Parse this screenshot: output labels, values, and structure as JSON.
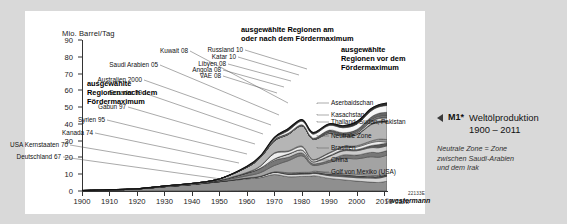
{
  "figure": {
    "panel_bg": "#ffffff",
    "page_bg": "#d9d9d9",
    "axis_title": "Mio. Barrel/Tag",
    "x_axis_name": "Jahr",
    "code": "22133E",
    "credit_symbol": "©",
    "credit": "westermann"
  },
  "caption": {
    "marker": "M1*",
    "title_line1": "Weltölproduktion",
    "title_line2": "1900 – 2011",
    "note_line1": "Neutrale Zone = Zone",
    "note_line2": "zwischen Saudi-Arabien",
    "note_line3": "und dem Irak"
  },
  "groups": {
    "left": "ausgewählte\nRegionen nach dem\nFördermaximum",
    "middle": "ausgewählte Regionen am\noder nach dem Fördermaximum",
    "right": "ausgewählte\nRegionen vor dem\nFördermaximum"
  },
  "callouts_left": [
    {
      "label": "Deutschland 67",
      "x": 36,
      "y": 142
    },
    {
      "label": "USA Kernstaaten 70",
      "x": 43,
      "y": 130
    },
    {
      "label": "Kanada 74",
      "x": 68,
      "y": 118
    },
    {
      "label": "Syrien 95",
      "x": 80,
      "y": 105
    },
    {
      "label": "Gabun 97",
      "x": 101,
      "y": 92
    },
    {
      "label": "Ecuador 99",
      "x": 117,
      "y": 78
    },
    {
      "label": "Australien 2000",
      "x": 117,
      "y": 65
    },
    {
      "label": "Saudi Arabien 05",
      "x": 133,
      "y": 50
    },
    {
      "label": "Kuwait 08",
      "x": 163,
      "y": 36
    }
  ],
  "callouts_middle": [
    {
      "label": "VAE 08",
      "x": 196,
      "y": 61
    },
    {
      "label": "Angola 08",
      "x": 196,
      "y": 55
    },
    {
      "label": "Libyen 08",
      "x": 201,
      "y": 49
    },
    {
      "label": "Katar 10",
      "x": 211,
      "y": 42
    },
    {
      "label": "Russland 10",
      "x": 218,
      "y": 35
    }
  ],
  "callouts_right": [
    {
      "label": "Aserbaidschan",
      "x": 306,
      "y": 88
    },
    {
      "label": "Kasachstan",
      "x": 306,
      "y": 100
    },
    {
      "label": "Thailand, Sudan, Pakistan",
      "x": 306,
      "y": 107
    },
    {
      "label": "Neutrale Zone",
      "x": 306,
      "y": 121
    },
    {
      "label": "Brasilien",
      "x": 306,
      "y": 133
    },
    {
      "label": "China",
      "x": 306,
      "y": 145
    },
    {
      "label": "Golf von Mexiko (USA)",
      "x": 306,
      "y": 157
    }
  ],
  "chart_data": {
    "type": "area",
    "title": "Weltölproduktion 1900 – 2011",
    "xlabel": "Jahr",
    "ylabel": "Mio. Barrel/Tag",
    "xlim": [
      1900,
      2011
    ],
    "ylim": [
      0,
      90
    ],
    "grid": false,
    "legend": "inline callout labels",
    "yticks": [
      0,
      10,
      20,
      30,
      40,
      50,
      60,
      70,
      80,
      90
    ],
    "xticks": [
      1900,
      1910,
      1920,
      1930,
      1940,
      1950,
      1960,
      1970,
      1980,
      1990,
      2000,
      2010
    ],
    "x": [
      1900,
      1910,
      1920,
      1930,
      1940,
      1950,
      1960,
      1965,
      1970,
      1975,
      1980,
      1983,
      1985,
      1990,
      1995,
      2000,
      2005,
      2008,
      2011
    ],
    "total_values": [
      0.4,
      1.0,
      2.0,
      3.8,
      5.9,
      10.9,
      21.0,
      30.0,
      45.7,
      53.0,
      62.9,
      53.5,
      54.0,
      60.5,
      62.4,
      68.3,
      73.8,
      73.7,
      74.0
    ],
    "series": [
      {
        "name": "Deutschland 67",
        "peak_year": 1967,
        "values": [
          0.0,
          0.0,
          0.0,
          0.1,
          0.1,
          0.1,
          0.2,
          0.2,
          0.2,
          0.1,
          0.1,
          0.1,
          0.1,
          0.1,
          0.1,
          0.1,
          0.1,
          0.1,
          0.1
        ]
      },
      {
        "name": "USA Kernstaaten 70",
        "peak_year": 1970,
        "values": [
          0.2,
          0.6,
          1.2,
          2.5,
          3.7,
          5.4,
          7.0,
          7.8,
          9.6,
          8.4,
          8.6,
          8.7,
          8.9,
          7.4,
          6.6,
          5.8,
          5.2,
          5.0,
          5.7
        ]
      },
      {
        "name": "Kanada 74",
        "peak_year": 1974,
        "values": [
          0.0,
          0.0,
          0.0,
          0.0,
          0.1,
          0.1,
          0.5,
          0.8,
          1.3,
          1.4,
          1.4,
          1.4,
          1.5,
          1.6,
          1.8,
          2.0,
          2.4,
          2.6,
          3.0
        ]
      },
      {
        "name": "Syrien 95",
        "peak_year": 1995,
        "values": [
          0,
          0,
          0,
          0,
          0,
          0,
          0.0,
          0.0,
          0.1,
          0.2,
          0.2,
          0.2,
          0.2,
          0.4,
          0.6,
          0.5,
          0.4,
          0.4,
          0.3
        ]
      },
      {
        "name": "Gabun 97",
        "peak_year": 1997,
        "values": [
          0,
          0,
          0,
          0,
          0,
          0,
          0.0,
          0.0,
          0.1,
          0.2,
          0.2,
          0.2,
          0.2,
          0.3,
          0.3,
          0.3,
          0.2,
          0.2,
          0.2
        ]
      },
      {
        "name": "Ecuador 99",
        "peak_year": 1999,
        "values": [
          0,
          0,
          0,
          0,
          0,
          0,
          0.0,
          0.0,
          0.0,
          0.2,
          0.2,
          0.2,
          0.3,
          0.3,
          0.4,
          0.4,
          0.5,
          0.5,
          0.5
        ]
      },
      {
        "name": "Australien 2000",
        "peak_year": 2000,
        "values": [
          0,
          0,
          0,
          0,
          0,
          0,
          0.0,
          0.0,
          0.1,
          0.4,
          0.4,
          0.4,
          0.6,
          0.6,
          0.6,
          0.8,
          0.6,
          0.5,
          0.5
        ]
      },
      {
        "name": "Saudi Arabien 05",
        "peak_year": 2005,
        "values": [
          0,
          0,
          0,
          0,
          0.0,
          0.5,
          1.3,
          2.2,
          3.8,
          7.1,
          9.9,
          5.1,
          3.4,
          6.4,
          9.0,
          9.3,
          11.0,
          10.8,
          11.1
        ]
      },
      {
        "name": "Kuwait 08",
        "peak_year": 2008,
        "values": [
          0,
          0,
          0,
          0,
          0,
          0.3,
          1.7,
          2.4,
          3.0,
          2.1,
          1.7,
          1.1,
          1.0,
          1.2,
          2.1,
          2.2,
          2.6,
          2.7,
          2.7
        ]
      },
      {
        "name": "VAE 08",
        "peak_year": 2008,
        "values": [
          0,
          0,
          0,
          0,
          0,
          0,
          0.0,
          0.3,
          0.8,
          1.7,
          1.7,
          1.1,
          1.2,
          2.3,
          2.4,
          2.6,
          2.8,
          3.0,
          2.8
        ]
      },
      {
        "name": "Angola 08",
        "peak_year": 2008,
        "values": [
          0,
          0,
          0,
          0,
          0,
          0,
          0.0,
          0.0,
          0.1,
          0.2,
          0.1,
          0.2,
          0.2,
          0.5,
          0.6,
          0.7,
          1.2,
          1.9,
          1.7
        ]
      },
      {
        "name": "Libyen 08",
        "peak_year": 2008,
        "values": [
          0,
          0,
          0,
          0,
          0,
          0,
          0.2,
          1.2,
          3.3,
          1.5,
          1.8,
          1.1,
          1.0,
          1.4,
          1.4,
          1.5,
          1.7,
          1.8,
          0.5
        ]
      },
      {
        "name": "Katar 10",
        "peak_year": 2010,
        "values": [
          0,
          0,
          0,
          0,
          0,
          0.0,
          0.2,
          0.2,
          0.4,
          0.4,
          0.5,
          0.3,
          0.3,
          0.4,
          0.5,
          0.8,
          1.0,
          1.4,
          1.6
        ]
      },
      {
        "name": "Russland 10",
        "peak_year": 2010,
        "values": [
          0.1,
          0.2,
          0.1,
          0.4,
          0.6,
          0.8,
          3.0,
          4.9,
          7.1,
          9.8,
          12.1,
          12.3,
          11.9,
          11.4,
          6.3,
          6.5,
          9.6,
          9.9,
          10.3
        ]
      },
      {
        "name": "Aserbaidschan",
        "peak_year": null,
        "values": [
          0,
          0,
          0,
          0,
          0,
          0,
          0.0,
          0.0,
          0.0,
          0.0,
          0.0,
          0.0,
          0.0,
          0.3,
          0.2,
          0.3,
          0.5,
          0.9,
          0.9
        ]
      },
      {
        "name": "Kasachstan",
        "peak_year": null,
        "values": [
          0,
          0,
          0,
          0,
          0,
          0,
          0.0,
          0.0,
          0.0,
          0.0,
          0.0,
          0.0,
          0.0,
          0.6,
          0.5,
          0.7,
          1.3,
          1.5,
          1.6
        ]
      },
      {
        "name": "Thailand, Sudan, Pakistan",
        "peak_year": null,
        "values": [
          0,
          0,
          0,
          0,
          0,
          0,
          0.0,
          0.0,
          0.0,
          0.0,
          0.0,
          0.0,
          0.0,
          0.1,
          0.1,
          0.2,
          0.4,
          0.6,
          0.7
        ]
      },
      {
        "name": "Neutrale Zone",
        "peak_year": null,
        "values": [
          0,
          0,
          0,
          0,
          0,
          0.0,
          0.2,
          0.4,
          0.5,
          0.5,
          0.4,
          0.3,
          0.3,
          0.3,
          0.4,
          0.6,
          0.6,
          0.6,
          0.5
        ]
      },
      {
        "name": "Brasilien",
        "peak_year": null,
        "values": [
          0,
          0,
          0,
          0,
          0,
          0.0,
          0.1,
          0.1,
          0.2,
          0.2,
          0.2,
          0.4,
          0.6,
          0.7,
          0.8,
          1.3,
          1.7,
          1.9,
          2.2
        ]
      },
      {
        "name": "China",
        "peak_year": null,
        "values": [
          0,
          0,
          0,
          0,
          0,
          0.0,
          0.1,
          0.2,
          0.6,
          1.5,
          2.1,
          2.1,
          2.5,
          2.8,
          3.0,
          3.2,
          3.6,
          3.8,
          4.1
        ]
      },
      {
        "name": "Golf von Mexiko (USA)",
        "peak_year": null,
        "values": [
          0,
          0,
          0,
          0,
          0,
          0.0,
          0.2,
          0.4,
          0.8,
          1.3,
          1.0,
          1.0,
          1.0,
          1.0,
          1.2,
          1.6,
          1.5,
          1.3,
          1.5
        ]
      }
    ]
  }
}
